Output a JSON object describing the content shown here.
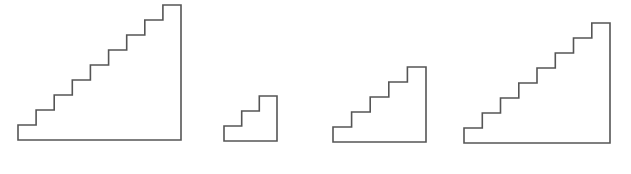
{
  "diagram": {
    "type": "staircase-outlines",
    "stroke_color": "#555555",
    "stroke_width": 1.6,
    "background": "#ffffff",
    "staircases": [
      {
        "id": "staircase-9",
        "steps": 9,
        "left": 18,
        "bottom": 140,
        "right": 181,
        "top": 5
      },
      {
        "id": "staircase-3",
        "steps": 3,
        "left": 224,
        "bottom": 141,
        "right": 277,
        "top": 96
      },
      {
        "id": "staircase-5",
        "steps": 5,
        "left": 333,
        "bottom": 142,
        "right": 426,
        "top": 67
      },
      {
        "id": "staircase-8",
        "steps": 8,
        "left": 464,
        "bottom": 143,
        "right": 610,
        "top": 23
      }
    ]
  }
}
